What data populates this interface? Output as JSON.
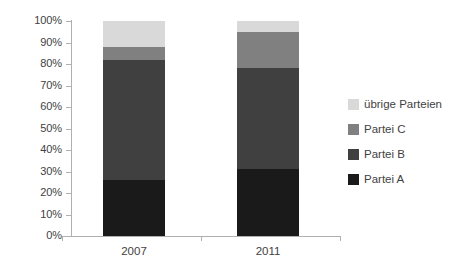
{
  "chart_data": {
    "type": "bar",
    "stacked": true,
    "title": "",
    "subtitle": "",
    "xlabel": "",
    "ylabel": "",
    "categories": [
      "2007",
      "2011"
    ],
    "series": [
      {
        "name": "Partei A",
        "color": "#1a1a1a",
        "values": [
          26,
          31
        ]
      },
      {
        "name": "Partei B",
        "color": "#404040",
        "values": [
          56,
          47
        ]
      },
      {
        "name": "Partei C",
        "color": "#808080",
        "values": [
          6,
          17
        ]
      },
      {
        "name": "übrige Parteien",
        "color": "#d9d9d9",
        "values": [
          12,
          5
        ]
      }
    ],
    "ylim": [
      0,
      100
    ],
    "yticks": [
      "0%",
      "10%",
      "20%",
      "30%",
      "40%",
      "50%",
      "60%",
      "70%",
      "80%",
      "90%",
      "100%"
    ],
    "ytick_values": [
      0,
      10,
      20,
      30,
      40,
      50,
      60,
      70,
      80,
      90,
      100
    ],
    "grid": false,
    "legend_position": "right",
    "legend_order": [
      "übrige Parteien",
      "Partei C",
      "Partei B",
      "Partei A"
    ]
  },
  "axis": {
    "y_labels": [
      "100%",
      "90%",
      "80%",
      "70%",
      "60%",
      "50%",
      "40%",
      "30%",
      "20%",
      "10%",
      "0%"
    ],
    "x_labels": [
      "2007",
      "2011"
    ]
  },
  "legend": {
    "items": [
      {
        "label": "übrige Parteien",
        "color": "#d9d9d9"
      },
      {
        "label": "Partei C",
        "color": "#808080"
      },
      {
        "label": "Partei B",
        "color": "#404040"
      },
      {
        "label": "Partei A",
        "color": "#1a1a1a"
      }
    ]
  },
  "colors": {
    "axis": "#b0b0b0",
    "text": "#3f3f3f",
    "background": "#ffffff"
  }
}
